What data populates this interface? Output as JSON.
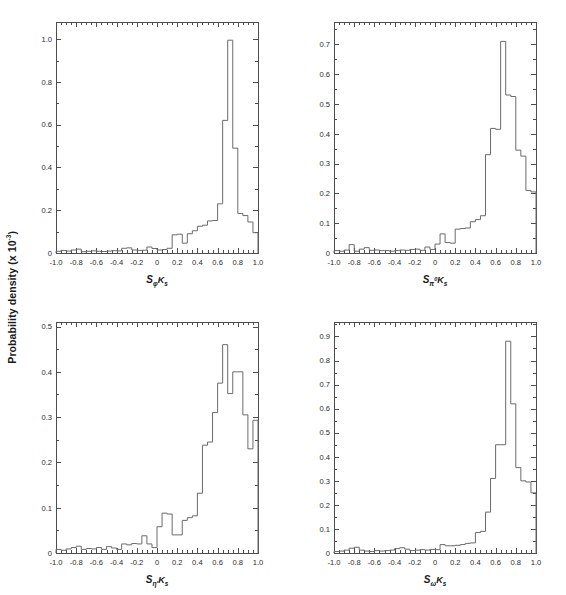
{
  "figure": {
    "ylabel": "Probability density (x 10",
    "ylabel_exponent": "-3",
    "ylabel_close": ")",
    "background": "#ffffff",
    "line_color": "#6b6b6b",
    "axis_color": "#4d4d4d"
  },
  "chart_data": [
    {
      "type": "bar",
      "panel": "top-left",
      "title": "",
      "xlabel": "S_phiKs",
      "xlabel_parts": {
        "base": "S",
        "sub1": "φ",
        "sub2": "K",
        "sub3": "s"
      },
      "ylabel": "Probability density (x 10^-3)",
      "xlim": [
        -1.0,
        1.0
      ],
      "ylim": [
        0,
        1.08
      ],
      "xticks": [
        -1.0,
        -0.8,
        -0.6,
        -0.4,
        -0.2,
        0,
        0.2,
        0.4,
        0.6,
        0.8,
        1.0
      ],
      "xticklabels": [
        "-1.0",
        "-0.8",
        "-0.6",
        "-0.4",
        "-0.2",
        "0",
        "0.2",
        "0.4",
        "0.6",
        "0.8",
        "1.0"
      ],
      "yticks": [
        0,
        0.2,
        0.4,
        0.6,
        0.8,
        1.0
      ],
      "yticklabels": [
        "0",
        "0.2",
        "0.4",
        "0.6",
        "0.8",
        "1.0"
      ],
      "grid": false,
      "bin_edges": [
        -1.0,
        -0.95,
        -0.9,
        -0.85,
        -0.8,
        -0.75,
        -0.7,
        -0.65,
        -0.6,
        -0.55,
        -0.5,
        -0.45,
        -0.4,
        -0.35,
        -0.3,
        -0.25,
        -0.2,
        -0.15,
        -0.1,
        -0.05,
        0.0,
        0.05,
        0.1,
        0.15,
        0.2,
        0.25,
        0.3,
        0.35,
        0.4,
        0.45,
        0.5,
        0.55,
        0.6,
        0.65,
        0.7,
        0.75,
        0.8,
        0.85,
        0.9,
        0.95,
        1.0
      ],
      "values": [
        0.008,
        0.012,
        0.009,
        0.014,
        0.018,
        0.006,
        0.008,
        0.01,
        0.008,
        0.007,
        0.009,
        0.011,
        0.01,
        0.022,
        0.024,
        0.014,
        0.012,
        0.013,
        0.028,
        0.021,
        0.014,
        0.016,
        0.022,
        0.085,
        0.088,
        0.046,
        0.09,
        0.104,
        0.125,
        0.13,
        0.15,
        0.152,
        0.23,
        0.62,
        0.995,
        0.49,
        0.185,
        0.175,
        0.145,
        0.095
      ]
    },
    {
      "type": "bar",
      "panel": "top-right",
      "title": "",
      "xlabel": "S_pi0Ks",
      "xlabel_parts": {
        "base": "S",
        "sub1": "π",
        "sup1": "0",
        "sub2": "K",
        "sub3": "s"
      },
      "ylabel": "Probability density (x 10^-3)",
      "xlim": [
        -1.0,
        1.0
      ],
      "ylim": [
        0,
        0.775
      ],
      "xticks": [
        -1.0,
        -0.8,
        -0.6,
        -0.4,
        -0.2,
        0,
        0.2,
        0.4,
        0.6,
        0.8,
        1.0
      ],
      "xticklabels": [
        "-1.0",
        "-0.8",
        "-0.6",
        "-0.4",
        "-0.2",
        "0",
        "0.2",
        "0.4",
        "0.6",
        "0.8",
        "1.0"
      ],
      "yticks": [
        0,
        0.1,
        0.2,
        0.3,
        0.4,
        0.5,
        0.6,
        0.7
      ],
      "yticklabels": [
        "0",
        "0.1",
        "0.2",
        "0.3",
        "0.4",
        "0.5",
        "0.6",
        "0.7"
      ],
      "grid": false,
      "bin_edges": [
        -1.0,
        -0.95,
        -0.9,
        -0.85,
        -0.8,
        -0.75,
        -0.7,
        -0.65,
        -0.6,
        -0.55,
        -0.5,
        -0.45,
        -0.4,
        -0.35,
        -0.3,
        -0.25,
        -0.2,
        -0.15,
        -0.1,
        -0.05,
        0.0,
        0.05,
        0.1,
        0.15,
        0.2,
        0.25,
        0.3,
        0.35,
        0.4,
        0.45,
        0.5,
        0.55,
        0.6,
        0.65,
        0.7,
        0.75,
        0.8,
        0.85,
        0.9,
        0.95,
        1.0
      ],
      "values": [
        0.008,
        0.006,
        0.01,
        0.028,
        0.006,
        0.013,
        0.018,
        0.009,
        0.01,
        0.008,
        0.008,
        0.006,
        0.008,
        0.01,
        0.009,
        0.012,
        0.013,
        0.009,
        0.02,
        0.012,
        0.03,
        0.064,
        0.035,
        0.033,
        0.08,
        0.082,
        0.084,
        0.105,
        0.112,
        0.125,
        0.33,
        0.418,
        0.415,
        0.71,
        0.53,
        0.525,
        0.345,
        0.325,
        0.21,
        0.205
      ]
    },
    {
      "type": "bar",
      "panel": "bottom-left",
      "title": "",
      "xlabel": "S_etaprimeKs",
      "xlabel_parts": {
        "base": "S",
        "sub1": "η′",
        "sub2": "K",
        "sub3": "s"
      },
      "ylabel": "Probability density (x 10^-3)",
      "xlim": [
        -1.0,
        1.0
      ],
      "ylim": [
        0,
        0.51
      ],
      "xticks": [
        -1.0,
        -0.8,
        -0.6,
        -0.4,
        -0.2,
        0,
        0.2,
        0.4,
        0.6,
        0.8,
        1.0
      ],
      "xticklabels": [
        "-1.0",
        "-0.8",
        "-0.6",
        "-0.4",
        "-0.2",
        "0",
        "0.2",
        "0.4",
        "0.6",
        "0.8",
        "1.0"
      ],
      "yticks": [
        0,
        0.1,
        0.2,
        0.3,
        0.4,
        0.5
      ],
      "yticklabels": [
        "0",
        "0.1",
        "0.2",
        "0.3",
        "0.4",
        "0.5"
      ],
      "grid": false,
      "bin_edges": [
        -1.0,
        -0.95,
        -0.9,
        -0.85,
        -0.8,
        -0.75,
        -0.7,
        -0.65,
        -0.6,
        -0.55,
        -0.5,
        -0.45,
        -0.4,
        -0.35,
        -0.3,
        -0.25,
        -0.2,
        -0.15,
        -0.1,
        -0.05,
        0.0,
        0.05,
        0.1,
        0.15,
        0.2,
        0.25,
        0.3,
        0.35,
        0.4,
        0.45,
        0.5,
        0.55,
        0.6,
        0.65,
        0.7,
        0.75,
        0.8,
        0.85,
        0.9,
        0.95,
        1.0
      ],
      "values": [
        0.008,
        0.006,
        0.009,
        0.012,
        0.015,
        0.008,
        0.01,
        0.009,
        0.012,
        0.008,
        0.014,
        0.011,
        0.008,
        0.02,
        0.018,
        0.021,
        0.02,
        0.038,
        0.02,
        0.012,
        0.058,
        0.088,
        0.086,
        0.04,
        0.04,
        0.072,
        0.078,
        0.082,
        0.132,
        0.238,
        0.245,
        0.31,
        0.375,
        0.46,
        0.352,
        0.4,
        0.4,
        0.305,
        0.23,
        0.293
      ]
    },
    {
      "type": "bar",
      "panel": "bottom-right",
      "title": "",
      "xlabel": "S_omegaKs",
      "xlabel_parts": {
        "base": "S",
        "sub1": "ω",
        "sub2": "K",
        "sub3": "s"
      },
      "ylabel": "Probability density (x 10^-3)",
      "xlim": [
        -1.0,
        1.0
      ],
      "ylim": [
        0,
        0.96
      ],
      "xticks": [
        -1.0,
        -0.8,
        -0.6,
        -0.4,
        -0.2,
        0,
        0.2,
        0.4,
        0.6,
        0.8,
        1.0
      ],
      "xticklabels": [
        "-1.0",
        "-0.8",
        "-0.6",
        "-0.4",
        "-0.2",
        "0",
        "0.2",
        "0.4",
        "0.6",
        "0.8",
        "1.0"
      ],
      "yticks": [
        0,
        0.1,
        0.2,
        0.3,
        0.4,
        0.5,
        0.6,
        0.7,
        0.8,
        0.9
      ],
      "yticklabels": [
        "0",
        "0.1",
        "0.2",
        "0.3",
        "0.4",
        "0.5",
        "0.6",
        "0.7",
        "0.8",
        "0.9"
      ],
      "grid": false,
      "bin_edges": [
        -1.0,
        -0.95,
        -0.9,
        -0.85,
        -0.8,
        -0.75,
        -0.7,
        -0.65,
        -0.6,
        -0.55,
        -0.5,
        -0.45,
        -0.4,
        -0.35,
        -0.3,
        -0.25,
        -0.2,
        -0.15,
        -0.1,
        -0.05,
        0.0,
        0.05,
        0.1,
        0.15,
        0.2,
        0.25,
        0.3,
        0.35,
        0.4,
        0.45,
        0.5,
        0.55,
        0.6,
        0.65,
        0.7,
        0.75,
        0.8,
        0.85,
        0.9,
        0.95,
        1.0
      ],
      "values": [
        0.006,
        0.008,
        0.012,
        0.02,
        0.024,
        0.012,
        0.008,
        0.006,
        0.01,
        0.008,
        0.01,
        0.012,
        0.018,
        0.022,
        0.016,
        0.01,
        0.012,
        0.014,
        0.012,
        0.015,
        0.014,
        0.035,
        0.03,
        0.03,
        0.032,
        0.035,
        0.04,
        0.042,
        0.085,
        0.09,
        0.17,
        0.31,
        0.45,
        0.45,
        0.88,
        0.62,
        0.355,
        0.3,
        0.295,
        0.25
      ]
    }
  ]
}
